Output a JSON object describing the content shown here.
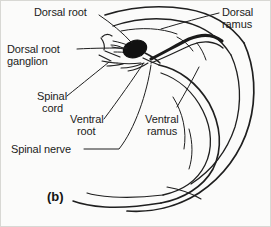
{
  "figure": {
    "caption": "(b)",
    "background_color": "#fbfbfa",
    "ink_color": "#1b1b1b",
    "border_color": "#d8d8d4"
  },
  "labels": {
    "dorsal_root": "Dorsal root",
    "dorsal_ramus_line1": "Dorsal",
    "dorsal_ramus_line2": "ramus",
    "dorsal_root_ganglion_line1": "Dorsal root",
    "dorsal_root_ganglion_line2": "ganglion",
    "spinal_cord_line1": "Spinal",
    "spinal_cord_line2": "cord",
    "ventral_root_line1": "Ventral",
    "ventral_root_line2": "root",
    "ventral_ramus_line1": "Ventral",
    "ventral_ramus_line2": "ramus",
    "spinal_nerve": "Spinal nerve"
  },
  "anatomy": {
    "parts": [
      "dorsal-root",
      "dorsal-root-ganglion",
      "spinal-cord",
      "ventral-root",
      "spinal-nerve",
      "dorsal-ramus",
      "ventral-ramus"
    ],
    "ganglion_fill": "#111111",
    "outline_color": "#1f1f1f"
  }
}
